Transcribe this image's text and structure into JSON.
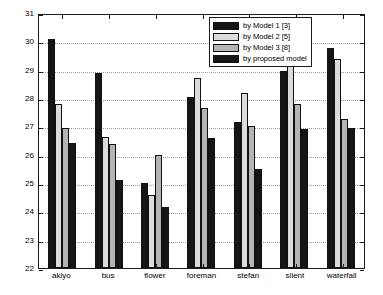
{
  "chart_data": {
    "type": "bar",
    "title": "",
    "xlabel": "",
    "ylabel": "",
    "ylim": [
      22,
      31
    ],
    "yticks": [
      22,
      23,
      24,
      25,
      26,
      27,
      28,
      29,
      30,
      31
    ],
    "grid": true,
    "legend_position": "top-right",
    "categories": [
      "akiyo",
      "bus",
      "flower",
      "foreman",
      "stefan",
      "silent",
      "waterfall"
    ],
    "series": [
      {
        "name": "by Model 1 [3]",
        "color": "#151515",
        "values": [
          30.1,
          28.9,
          25.0,
          28.05,
          27.15,
          28.95,
          29.78
        ]
      },
      {
        "name": "by Model 2 [5]",
        "color": "#dcdcdc",
        "values": [
          27.78,
          26.62,
          24.56,
          28.71,
          28.18,
          29.2,
          29.36
        ]
      },
      {
        "name": "by Model 3 [8]",
        "color": "#b4b4b4",
        "values": [
          26.95,
          26.37,
          26.0,
          27.66,
          27.0,
          27.78,
          27.26
        ]
      },
      {
        "name": "by proposed model",
        "color": "#151515",
        "values": [
          26.42,
          25.1,
          24.14,
          26.6,
          25.48,
          26.9,
          26.95
        ]
      }
    ]
  }
}
